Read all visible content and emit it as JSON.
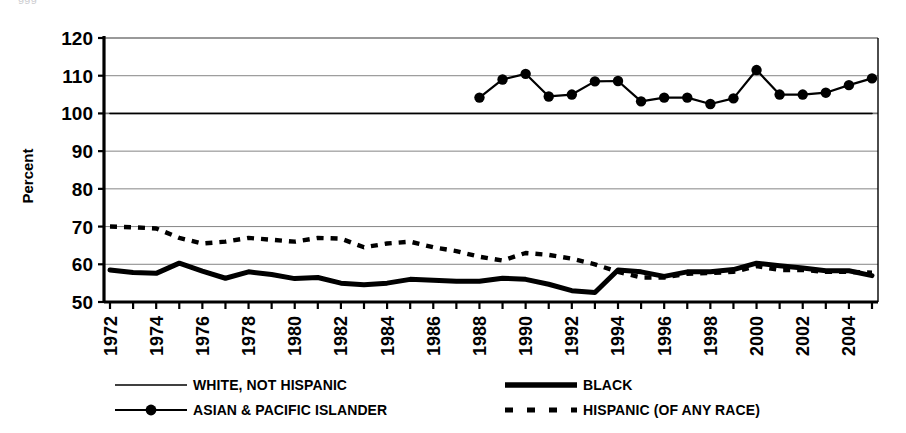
{
  "figure": {
    "cutoff_header": "ggg",
    "axis_title_y": "Percent",
    "plot_bg": "#ffffff",
    "ink_color": "#000000",
    "grid_color": "#777777"
  },
  "chart_data": {
    "type": "line",
    "title": "",
    "xlabel": "",
    "ylabel": "Percent",
    "ylim": [
      50,
      120
    ],
    "ytick_step": 10,
    "yticks": [
      50,
      60,
      70,
      80,
      90,
      100,
      110,
      120
    ],
    "ytick_labels": [
      "50",
      "60",
      "70",
      "80",
      "90",
      "100",
      "110",
      "120"
    ],
    "grid": true,
    "legend_position": "below",
    "x": [
      1972,
      1973,
      1974,
      1975,
      1976,
      1977,
      1978,
      1979,
      1980,
      1981,
      1982,
      1983,
      1984,
      1985,
      1986,
      1987,
      1988,
      1989,
      1990,
      1991,
      1992,
      1993,
      1994,
      1995,
      1996,
      1997,
      1998,
      1999,
      2000,
      2001,
      2002,
      2003,
      2004,
      2005
    ],
    "xtick_labels": [
      "1972",
      "",
      "1974",
      "",
      "1976",
      "",
      "1978",
      "",
      "1980",
      "",
      "1982",
      "",
      "1984",
      "",
      "1986",
      "",
      "1988",
      "",
      "1990",
      "",
      "1992",
      "",
      "1994",
      "",
      "1996",
      "",
      "1998",
      "",
      "2000",
      "",
      "2002",
      "",
      "2004",
      ""
    ],
    "xtick_labels_shown": [
      "1972",
      "1974",
      "1976",
      "1978",
      "1980",
      "1982",
      "1984",
      "1986",
      "1988",
      "1990",
      "1992",
      "1994",
      "1996",
      "1998",
      "2000",
      "2002",
      "2004"
    ],
    "series": [
      {
        "name": "WHITE, NOT HISPANIC",
        "style": "thin-solid",
        "color": "#000000",
        "values": [
          100,
          100,
          100,
          100,
          100,
          100,
          100,
          100,
          100,
          100,
          100,
          100,
          100,
          100,
          100,
          100,
          100,
          100,
          100,
          100,
          100,
          100,
          100,
          100,
          100,
          100,
          100,
          100,
          100,
          100,
          100,
          100,
          100,
          100
        ]
      },
      {
        "name": "BLACK",
        "style": "thick-solid",
        "color": "#000000",
        "values": [
          58.5,
          57.8,
          57.6,
          60.3,
          58.2,
          56.3,
          58.0,
          57.3,
          56.2,
          56.5,
          55.0,
          54.6,
          55.0,
          56.0,
          55.8,
          55.5,
          55.5,
          56.3,
          56.0,
          54.7,
          53.0,
          52.5,
          58.5,
          58.0,
          56.8,
          58.0,
          58.0,
          58.6,
          60.3,
          59.6,
          59.0,
          58.3,
          58.3,
          57.0
        ]
      },
      {
        "name": "ASIAN & PACIFIC ISLANDER",
        "style": "marker-solid",
        "color": "#000000",
        "start_year": 1988,
        "values": [
          null,
          null,
          null,
          null,
          null,
          null,
          null,
          null,
          null,
          null,
          null,
          null,
          null,
          null,
          null,
          null,
          104.2,
          109.0,
          110.5,
          104.5,
          105.0,
          108.5,
          108.6,
          103.2,
          104.2,
          104.2,
          102.5,
          104.0,
          111.5,
          105.0,
          105.0,
          105.5,
          107.5,
          109.3
        ]
      },
      {
        "name": "HISPANIC (OF ANY RACE)",
        "style": "dashed",
        "color": "#000000",
        "values": [
          70.0,
          69.8,
          69.5,
          67.0,
          65.5,
          66.0,
          67.0,
          66.5,
          66.0,
          67.0,
          66.8,
          64.5,
          65.5,
          66.0,
          64.5,
          63.5,
          62.0,
          61.0,
          63.0,
          62.5,
          61.5,
          60.0,
          58.0,
          56.5,
          56.5,
          57.5,
          57.7,
          58.0,
          59.5,
          58.5,
          58.5,
          58.0,
          58.0,
          57.8
        ]
      }
    ]
  },
  "legend": {
    "items": [
      {
        "label": "WHITE, NOT HISPANIC",
        "style": "thin-solid"
      },
      {
        "label": "BLACK",
        "style": "thick-solid"
      },
      {
        "label": "ASIAN & PACIFIC ISLANDER",
        "style": "marker-solid"
      },
      {
        "label": "HISPANIC (OF ANY RACE)",
        "style": "dashed"
      }
    ]
  }
}
